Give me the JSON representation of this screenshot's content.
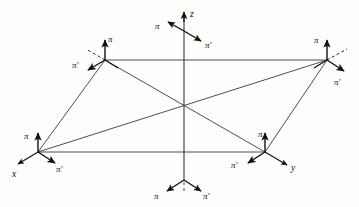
{
  "figure": {
    "background_color": "#fdfdfc",
    "line_color": "#3a3a3a",
    "arrow_color": "#111111",
    "label_color": "#111111",
    "canvas": {
      "width": 359,
      "height": 207
    }
  },
  "axes": {
    "z": {
      "label": "z",
      "origin": [
        184,
        180
      ],
      "tip": [
        184,
        12
      ]
    },
    "x": {
      "label": "x",
      "origin": [
        38,
        152
      ],
      "tip": [
        18,
        166
      ]
    },
    "y": {
      "label": "y",
      "origin": [
        265,
        152
      ],
      "tip": [
        288,
        166
      ]
    }
  },
  "parallelogram": {
    "vertices": [
      {
        "name": "top-left",
        "x": 105,
        "y": 60
      },
      {
        "name": "top-right",
        "x": 327,
        "y": 60
      },
      {
        "name": "bottom-right",
        "x": 265,
        "y": 152
      },
      {
        "name": "bottom-left",
        "x": 38,
        "y": 152
      }
    ],
    "diagonals": [
      {
        "from": "top-left",
        "to": "bottom-right"
      },
      {
        "from": "bottom-left",
        "to": "top-right"
      }
    ]
  },
  "pi_frames": [
    {
      "id": "frame-top-axis",
      "site": "z-axis-top",
      "origin": [
        184,
        31
      ],
      "pi_label": "π",
      "pi_prime_label": "π′",
      "pi_label_pos": [
        155,
        29
      ],
      "pi_prime_label_pos": [
        205,
        40
      ],
      "pi_vector": [
        -16,
        -9
      ],
      "pi_prime_vector": [
        17,
        10
      ],
      "has_dashed_guide": false
    },
    {
      "id": "frame-top-left",
      "site": "vertex-top-left",
      "origin": [
        105,
        60
      ],
      "pi_label": "π",
      "pi_prime_label": "π′",
      "pi_label_pos": [
        109,
        43
      ],
      "pi_prime_label_pos": [
        78,
        66
      ],
      "pi_vector": [
        0,
        -20
      ],
      "pi_prime_vector": [
        -17,
        10
      ],
      "has_dashed_guide": true,
      "dashed_guide_vector": [
        -19,
        -11
      ]
    },
    {
      "id": "frame-top-right",
      "site": "vertex-top-right",
      "origin": [
        327,
        60
      ],
      "pi_label": "π",
      "pi_prime_label": "π′",
      "pi_label_pos": [
        315,
        43
      ],
      "pi_prime_label_pos": [
        335,
        81
      ],
      "pi_vector": [
        0,
        -20
      ],
      "pi_prime_vector": [
        17,
        10
      ],
      "has_dashed_guide": true,
      "dashed_guide_vector": [
        19,
        -11
      ]
    },
    {
      "id": "frame-bottom-left",
      "site": "vertex-bottom-left",
      "origin": [
        38,
        152
      ],
      "pi_label": "π",
      "pi_prime_label": "π′",
      "pi_label_pos": [
        25,
        137
      ],
      "pi_prime_label_pos": [
        48,
        172
      ],
      "pi_vector": [
        0,
        -19
      ],
      "pi_prime_vector": [
        17,
        10
      ],
      "has_dashed_guide": false
    },
    {
      "id": "frame-bottom-right",
      "site": "vertex-bottom-right",
      "origin": [
        265,
        152
      ],
      "pi_label": "π",
      "pi_prime_label": "π′",
      "pi_label_pos": [
        258,
        137
      ],
      "pi_prime_label_pos": [
        235,
        170
      ],
      "pi_vector": [
        0,
        -19
      ],
      "pi_prime_vector": [
        -17,
        10
      ],
      "has_dashed_guide": false
    },
    {
      "id": "frame-bottom-axis",
      "site": "z-axis-bottom",
      "origin": [
        184,
        180
      ],
      "pi_label": "π",
      "pi_prime_label": "π′",
      "pi_label_pos": [
        156,
        197
      ],
      "pi_prime_label_pos": [
        204,
        197
      ],
      "pi_vector": [
        -17,
        10
      ],
      "pi_prime_vector": [
        17,
        10
      ],
      "has_dashed_guide": false
    }
  ],
  "labels": {
    "pi": "π",
    "pi_prime": "π′",
    "x": "x",
    "y": "y",
    "z": "z"
  }
}
